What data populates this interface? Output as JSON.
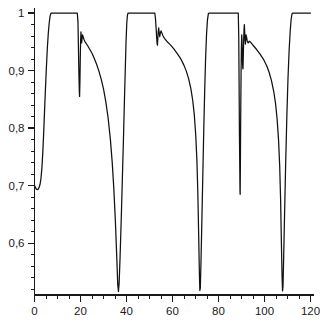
{
  "chart_data": {
    "type": "line",
    "title": "",
    "subtitle": "",
    "xlabel": "",
    "ylabel": "",
    "xlim": [
      0,
      120
    ],
    "ylim": [
      0.51,
      1.005
    ],
    "grid": false,
    "legend": null,
    "line_color": "#111111",
    "background_color": "#ffffff",
    "axis_color": "#1a1a1a",
    "x_ticks_major": [
      0,
      20,
      40,
      60,
      80,
      100,
      120
    ],
    "x_tick_labels": [
      "0",
      "20",
      "40",
      "60",
      "80",
      "100",
      "120"
    ],
    "x_minor_step": 5,
    "y_ticks_major": [
      0.6,
      0.7,
      0.8,
      0.9,
      1.0
    ],
    "y_tick_labels": [
      "0,6",
      "0,7",
      "0,8",
      "0,9",
      "1"
    ],
    "y_minor_step": 0.02,
    "series": [
      {
        "name": "signal",
        "points": [
          [
            0.0,
            0.7
          ],
          [
            0.4,
            0.697
          ],
          [
            0.8,
            0.694
          ],
          [
            1.2,
            0.693
          ],
          [
            1.6,
            0.694
          ],
          [
            2.0,
            0.697
          ],
          [
            2.4,
            0.702
          ],
          [
            2.8,
            0.712
          ],
          [
            3.2,
            0.73
          ],
          [
            3.6,
            0.757
          ],
          [
            4.0,
            0.793
          ],
          [
            4.4,
            0.833
          ],
          [
            4.8,
            0.872
          ],
          [
            5.2,
            0.908
          ],
          [
            5.6,
            0.94
          ],
          [
            6.0,
            0.965
          ],
          [
            6.4,
            0.983
          ],
          [
            6.8,
            0.995
          ],
          [
            7.2,
            1.0
          ],
          [
            8.0,
            1.0
          ],
          [
            10.0,
            1.0
          ],
          [
            14.0,
            1.0
          ],
          [
            17.0,
            1.0
          ],
          [
            18.6,
            1.0
          ],
          [
            18.9,
            0.985
          ],
          [
            19.1,
            0.94
          ],
          [
            19.3,
            0.895
          ],
          [
            19.5,
            0.862
          ],
          [
            19.6,
            0.855
          ],
          [
            19.75,
            0.88
          ],
          [
            19.9,
            0.92
          ],
          [
            20.05,
            0.952
          ],
          [
            20.2,
            0.967
          ],
          [
            20.35,
            0.958
          ],
          [
            20.5,
            0.948
          ],
          [
            20.7,
            0.956
          ],
          [
            20.9,
            0.962
          ],
          [
            21.2,
            0.958
          ],
          [
            21.6,
            0.953
          ],
          [
            22.0,
            0.95
          ],
          [
            23.0,
            0.944
          ],
          [
            24.0,
            0.937
          ],
          [
            25.0,
            0.93
          ],
          [
            26.0,
            0.921
          ],
          [
            27.0,
            0.911
          ],
          [
            28.0,
            0.899
          ],
          [
            29.0,
            0.885
          ],
          [
            30.0,
            0.868
          ],
          [
            31.0,
            0.846
          ],
          [
            32.0,
            0.818
          ],
          [
            33.0,
            0.78
          ],
          [
            33.8,
            0.74
          ],
          [
            34.5,
            0.694
          ],
          [
            35.2,
            0.635
          ],
          [
            35.8,
            0.572
          ],
          [
            36.2,
            0.528
          ],
          [
            36.5,
            0.516
          ],
          [
            36.8,
            0.531
          ],
          [
            37.2,
            0.575
          ],
          [
            37.7,
            0.64
          ],
          [
            38.2,
            0.712
          ],
          [
            38.7,
            0.785
          ],
          [
            39.1,
            0.848
          ],
          [
            39.5,
            0.906
          ],
          [
            39.8,
            0.95
          ],
          [
            40.1,
            0.981
          ],
          [
            40.4,
            0.996
          ],
          [
            40.7,
            1.0
          ],
          [
            42.0,
            1.0
          ],
          [
            46.0,
            1.0
          ],
          [
            50.0,
            1.0
          ],
          [
            52.3,
            1.0
          ],
          [
            52.6,
            0.99
          ],
          [
            52.9,
            0.972
          ],
          [
            53.1,
            0.958
          ],
          [
            53.3,
            0.947
          ],
          [
            53.45,
            0.944
          ],
          [
            53.6,
            0.955
          ],
          [
            53.8,
            0.968
          ],
          [
            54.0,
            0.974
          ],
          [
            54.2,
            0.966
          ],
          [
            54.45,
            0.959
          ],
          [
            54.7,
            0.965
          ],
          [
            55.0,
            0.969
          ],
          [
            55.4,
            0.965
          ],
          [
            55.9,
            0.96
          ],
          [
            56.5,
            0.956
          ],
          [
            57.5,
            0.951
          ],
          [
            59.0,
            0.945
          ],
          [
            60.5,
            0.938
          ],
          [
            62.0,
            0.93
          ],
          [
            63.5,
            0.921
          ],
          [
            65.0,
            0.909
          ],
          [
            66.0,
            0.899
          ],
          [
            67.0,
            0.886
          ],
          [
            68.0,
            0.868
          ],
          [
            68.8,
            0.848
          ],
          [
            69.5,
            0.822
          ],
          [
            70.1,
            0.788
          ],
          [
            70.6,
            0.745
          ],
          [
            71.0,
            0.69
          ],
          [
            71.4,
            0.61
          ],
          [
            71.7,
            0.545
          ],
          [
            71.9,
            0.518
          ],
          [
            72.1,
            0.522
          ],
          [
            72.4,
            0.57
          ],
          [
            72.8,
            0.645
          ],
          [
            73.2,
            0.722
          ],
          [
            73.6,
            0.798
          ],
          [
            74.0,
            0.866
          ],
          [
            74.4,
            0.922
          ],
          [
            74.8,
            0.963
          ],
          [
            75.2,
            0.988
          ],
          [
            75.6,
            0.999
          ],
          [
            76.0,
            1.0
          ],
          [
            78.0,
            1.0
          ],
          [
            82.0,
            1.0
          ],
          [
            86.0,
            1.0
          ],
          [
            88.6,
            1.0
          ],
          [
            88.8,
            0.96
          ],
          [
            88.95,
            0.88
          ],
          [
            89.1,
            0.79
          ],
          [
            89.25,
            0.73
          ],
          [
            89.35,
            0.69
          ],
          [
            89.42,
            0.685
          ],
          [
            89.52,
            0.74
          ],
          [
            89.65,
            0.82
          ],
          [
            89.8,
            0.89
          ],
          [
            89.95,
            0.938
          ],
          [
            90.1,
            0.962
          ],
          [
            90.25,
            0.95
          ],
          [
            90.4,
            0.92
          ],
          [
            90.55,
            0.905
          ],
          [
            90.65,
            0.903
          ],
          [
            90.8,
            0.928
          ],
          [
            90.95,
            0.955
          ],
          [
            91.1,
            0.972
          ],
          [
            91.25,
            0.98
          ],
          [
            91.4,
            0.966
          ],
          [
            91.55,
            0.952
          ],
          [
            91.7,
            0.946
          ],
          [
            91.85,
            0.955
          ],
          [
            92.0,
            0.962
          ],
          [
            92.2,
            0.958
          ],
          [
            92.5,
            0.951
          ],
          [
            92.9,
            0.948
          ],
          [
            93.4,
            0.951
          ],
          [
            94.0,
            0.949
          ],
          [
            95.0,
            0.944
          ],
          [
            96.5,
            0.937
          ],
          [
            98.0,
            0.929
          ],
          [
            99.5,
            0.92
          ],
          [
            101.0,
            0.908
          ],
          [
            102.0,
            0.897
          ],
          [
            103.0,
            0.883
          ],
          [
            104.0,
            0.864
          ],
          [
            104.8,
            0.843
          ],
          [
            105.5,
            0.815
          ],
          [
            106.1,
            0.78
          ],
          [
            106.6,
            0.735
          ],
          [
            107.0,
            0.676
          ],
          [
            107.35,
            0.6
          ],
          [
            107.65,
            0.54
          ],
          [
            107.85,
            0.517
          ],
          [
            108.05,
            0.525
          ],
          [
            108.35,
            0.578
          ],
          [
            108.75,
            0.655
          ],
          [
            109.2,
            0.738
          ],
          [
            109.7,
            0.818
          ],
          [
            110.2,
            0.885
          ],
          [
            110.7,
            0.935
          ],
          [
            111.2,
            0.97
          ],
          [
            111.6,
            0.99
          ],
          [
            112.0,
            0.999
          ],
          [
            112.4,
            1.0
          ],
          [
            114.0,
            1.0
          ],
          [
            116.0,
            1.0
          ],
          [
            118.0,
            1.0
          ],
          [
            120.0,
            1.0
          ]
        ]
      }
    ],
    "annotations": []
  }
}
